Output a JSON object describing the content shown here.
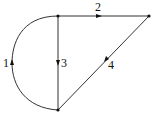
{
  "diagram": {
    "type": "directed-graph",
    "nodes": [
      {
        "id": "top",
        "x": 58,
        "y": 16
      },
      {
        "id": "right",
        "x": 149,
        "y": 16
      },
      {
        "id": "bottom",
        "x": 58,
        "y": 110
      }
    ],
    "edges": [
      {
        "label": "1",
        "from": "bottom",
        "to": "top",
        "shape": "arc-left"
      },
      {
        "label": "2",
        "from": "top",
        "to": "right",
        "shape": "straight"
      },
      {
        "label": "3",
        "from": "top",
        "to": "bottom",
        "shape": "straight"
      },
      {
        "label": "4",
        "from": "right",
        "to": "bottom",
        "shape": "straight"
      }
    ],
    "colors": {
      "stroke": "#333333",
      "node": "#111111",
      "background": "#ffffff"
    }
  }
}
